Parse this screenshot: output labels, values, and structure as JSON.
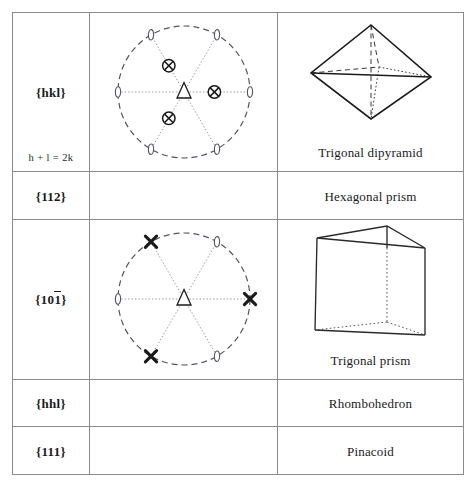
{
  "page": {
    "top_bleed_text": "",
    "background": "#ffffff",
    "ink": "#1a1a1a",
    "grid_color": "#8a8a93"
  },
  "table": {
    "columns": [
      "form-symbol",
      "stereogram",
      "form-name"
    ],
    "rows": [
      {
        "id": "row-hkl",
        "form_symbol": "{hkl}",
        "form_symbol_parts": [
          {
            "text": "{hkl}",
            "overbar": false
          }
        ],
        "condition": "h + l = 2k",
        "stereogram": "trigonal-dipyramid-stereogram",
        "solid": "trigonal-dipyramid",
        "form_name": "Trigonal dipyramid",
        "tall": true
      },
      {
        "id": "row-112",
        "form_symbol": "{112}",
        "form_symbol_parts": [
          {
            "text": "{112}",
            "overbar": false
          }
        ],
        "condition": "",
        "stereogram": "",
        "solid": "",
        "form_name": "Hexagonal prism",
        "tall": false
      },
      {
        "id": "row-101bar",
        "form_symbol": "{101̄}",
        "form_symbol_parts": [
          {
            "text": "{10",
            "overbar": false
          },
          {
            "text": "1",
            "overbar": true
          },
          {
            "text": "}",
            "overbar": false
          }
        ],
        "condition": "",
        "stereogram": "trigonal-prism-stereogram",
        "solid": "trigonal-prism",
        "form_name": "Trigonal prism",
        "tall": true
      },
      {
        "id": "row-hhl",
        "form_symbol": "{hhl}",
        "form_symbol_parts": [
          {
            "text": "{hhl}",
            "overbar": false
          }
        ],
        "condition": "",
        "stereogram": "",
        "solid": "",
        "form_name": "Rhombohedron",
        "tall": false
      },
      {
        "id": "row-111",
        "form_symbol": "{111}",
        "form_symbol_parts": [
          {
            "text": "{111}",
            "overbar": false
          }
        ],
        "condition": "",
        "stereogram": "",
        "solid": "",
        "form_name": "Pinacoid",
        "tall": false
      }
    ]
  },
  "stereograms": {
    "trigonal_dipyramid": {
      "primitive_circle": "dashed",
      "center_symbol": "open-triangle-3fold-axis",
      "pole_symbol": "crossed-circle",
      "pole_azimuths_deg": [
        0,
        120,
        240
      ],
      "pole_radius_fraction": 0.46,
      "perimeter_symbol": "open-ellipse-2fold-axis",
      "perimeter_azimuths_deg": [
        0,
        60,
        120,
        180,
        240,
        300
      ],
      "radial_lines_deg": [
        0,
        60,
        120,
        180,
        240,
        300
      ],
      "radial_line_style": "dotted"
    },
    "trigonal_prism": {
      "primitive_circle": "dashed",
      "center_symbol": "open-triangle-3fold-axis",
      "perimeter_symbols": [
        {
          "azimuth_deg": 0,
          "symbol": "bold-x"
        },
        {
          "azimuth_deg": 60,
          "symbol": "open-ellipse-2fold-axis"
        },
        {
          "azimuth_deg": 120,
          "symbol": "bold-x"
        },
        {
          "azimuth_deg": 180,
          "symbol": "open-ellipse-2fold-axis"
        },
        {
          "azimuth_deg": 240,
          "symbol": "bold-x"
        },
        {
          "azimuth_deg": 300,
          "symbol": "open-ellipse-2fold-axis"
        }
      ],
      "radial_lines_deg": [
        0,
        60,
        120,
        180,
        240,
        300
      ],
      "radial_line_style": "dotted"
    }
  }
}
